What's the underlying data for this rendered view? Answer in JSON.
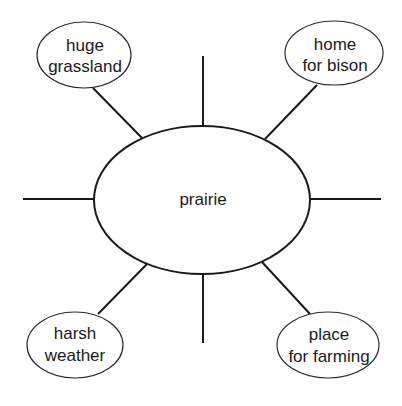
{
  "diagram": {
    "type": "word-web",
    "center": {
      "label": "prairie"
    },
    "nodes": [
      {
        "position": "top-left",
        "line1": "huge",
        "line2": "grassland"
      },
      {
        "position": "top-right",
        "line1": "home",
        "line2": "for bison"
      },
      {
        "position": "bottom-left",
        "line1": "harsh",
        "line2": "weather"
      },
      {
        "position": "bottom-right",
        "line1": "place",
        "line2": "for farming"
      }
    ],
    "empty_spokes": [
      "top",
      "bottom",
      "left",
      "right"
    ],
    "colors": {
      "line": "#1a1a1a",
      "background": "#ffffff",
      "text": "#1a1a1a"
    }
  }
}
